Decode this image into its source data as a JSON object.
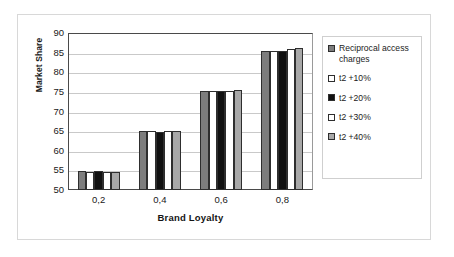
{
  "chart_data": {
    "type": "bar",
    "title": "",
    "xlabel": "Brand Loyalty",
    "ylabel": "Market Share",
    "categories": [
      "0,2",
      "0,4",
      "0,6",
      "0,8"
    ],
    "ylim": [
      50,
      90
    ],
    "yticks": [
      50,
      55,
      60,
      65,
      70,
      75,
      80,
      85,
      90
    ],
    "grid": true,
    "legend_position": "right",
    "series": [
      {
        "name": "Reciprocal access charges",
        "color": "#7d7d7d",
        "values": [
          54.9,
          65.0,
          75.1,
          85.3
        ]
      },
      {
        "name": "t2 +10%",
        "color": "#ffffff",
        "values": [
          54.7,
          65.0,
          75.2,
          85.3
        ]
      },
      {
        "name": "t2 +20%",
        "color": "#111111",
        "values": [
          54.8,
          64.9,
          75.2,
          85.5
        ]
      },
      {
        "name": "t2 +30%",
        "color": "#ffffff",
        "values": [
          54.5,
          65.0,
          75.2,
          85.9
        ]
      },
      {
        "name": "t2 +40%",
        "color": "#a8a8a8",
        "values": [
          54.5,
          65.1,
          75.5,
          86.1
        ]
      }
    ]
  },
  "axes": {
    "y_title": "Market Share",
    "x_title": "Brand Loyalty",
    "y_tick_labels": [
      "90",
      "85",
      "80",
      "75",
      "70",
      "65",
      "60",
      "55",
      "50"
    ],
    "x_tick_labels": [
      "0,2",
      "0,4",
      "0,6",
      "0,8"
    ]
  },
  "legend": {
    "items": [
      {
        "label": "Reciprocal access\ncharges",
        "swatch": "#7d7d7d"
      },
      {
        "label": "t2 +10%",
        "swatch": "#ffffff"
      },
      {
        "label": "t2 +20%",
        "swatch": "#111111"
      },
      {
        "label": "t2 +30%",
        "swatch": "#ffffff"
      },
      {
        "label": "t2 +40%",
        "swatch": "#a8a8a8"
      }
    ]
  }
}
